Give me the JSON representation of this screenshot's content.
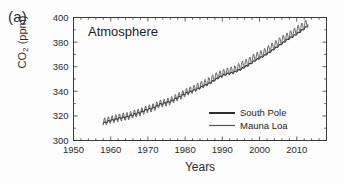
{
  "figure": {
    "panel_label": "(a)",
    "background_color": "#fdfdfd",
    "axis_color": "#3a3a3a"
  },
  "chart_data": {
    "type": "line",
    "title": "Atmosphere",
    "xlabel": "Years",
    "ylabel": "CO2 (ppm)",
    "ylabel_base": "CO",
    "ylabel_sub": "2",
    "ylabel_unit": " (ppm)",
    "xlim": [
      1950,
      2018
    ],
    "ylim": [
      300,
      400
    ],
    "xticks": [
      1950,
      1960,
      1970,
      1980,
      1990,
      2000,
      2010
    ],
    "xtick_labels": [
      "1950",
      "1960",
      "1970",
      "1980",
      "1990",
      "2000",
      "2010"
    ],
    "yticks": [
      300,
      320,
      340,
      360,
      380,
      400
    ],
    "ytick_labels": [
      "300",
      "320",
      "340",
      "360",
      "380",
      "400"
    ],
    "x_minor_step": 2,
    "y_minor_step": 10,
    "grid": false,
    "legend_position": "lower-right",
    "seasonal_amplitude_south_pole": 0.6,
    "seasonal_amplitude_mauna_loa": 3.1,
    "series": [
      {
        "name": "South Pole",
        "color": "#2e2e2e",
        "line_width": 1.1,
        "x": [
          1958.0,
          1959.0,
          1960.0,
          1961.0,
          1962.0,
          1963.0,
          1964.0,
          1965.0,
          1966.0,
          1967.0,
          1968.0,
          1969.0,
          1970.0,
          1971.0,
          1972.0,
          1973.0,
          1974.0,
          1975.0,
          1976.0,
          1977.0,
          1978.0,
          1979.0,
          1980.0,
          1981.0,
          1982.0,
          1983.0,
          1984.0,
          1985.0,
          1986.0,
          1987.0,
          1988.0,
          1989.0,
          1990.0,
          1991.0,
          1992.0,
          1993.0,
          1994.0,
          1995.0,
          1996.0,
          1997.0,
          1998.0,
          1999.0,
          2000.0,
          2001.0,
          2002.0,
          2003.0,
          2004.0,
          2005.0,
          2006.0,
          2007.0,
          2008.0,
          2009.0,
          2010.0,
          2011.0,
          2012.0,
          2013.0
        ],
        "values": [
          314.0,
          315.3,
          316.4,
          317.0,
          317.9,
          318.6,
          319.0,
          319.8,
          321.0,
          322.0,
          322.9,
          324.3,
          325.4,
          326.1,
          327.3,
          329.1,
          330.0,
          330.9,
          331.8,
          333.2,
          334.8,
          336.4,
          338.1,
          339.2,
          340.3,
          341.5,
          343.0,
          344.4,
          345.8,
          347.4,
          349.2,
          351.2,
          352.7,
          354.0,
          354.6,
          355.4,
          356.6,
          358.0,
          359.7,
          361.3,
          363.4,
          365.4,
          367.0,
          368.5,
          370.4,
          372.4,
          374.6,
          376.6,
          378.8,
          380.9,
          383.0,
          384.6,
          386.6,
          388.7,
          390.9,
          393.4
        ]
      },
      {
        "name": "Mauna Loa",
        "color": "#555555",
        "line_width": 0.9,
        "x": [
          1958.0,
          1959.0,
          1960.0,
          1961.0,
          1962.0,
          1963.0,
          1964.0,
          1965.0,
          1966.0,
          1967.0,
          1968.0,
          1969.0,
          1970.0,
          1971.0,
          1972.0,
          1973.0,
          1974.0,
          1975.0,
          1976.0,
          1977.0,
          1978.0,
          1979.0,
          1980.0,
          1981.0,
          1982.0,
          1983.0,
          1984.0,
          1985.0,
          1986.0,
          1987.0,
          1988.0,
          1989.0,
          1990.0,
          1991.0,
          1992.0,
          1993.0,
          1994.0,
          1995.0,
          1996.0,
          1997.0,
          1998.0,
          1999.0,
          2000.0,
          2001.0,
          2002.0,
          2003.0,
          2004.0,
          2005.0,
          2006.0,
          2007.0,
          2008.0,
          2009.0,
          2010.0,
          2011.0,
          2012.0,
          2013.0
        ],
        "values": [
          315.0,
          315.9,
          316.9,
          317.6,
          318.4,
          319.0,
          319.6,
          320.0,
          321.4,
          322.2,
          323.0,
          324.6,
          325.7,
          326.3,
          327.5,
          329.7,
          330.2,
          331.1,
          332.0,
          333.8,
          335.4,
          336.8,
          338.7,
          340.1,
          341.4,
          343.0,
          344.6,
          346.0,
          347.4,
          349.2,
          351.6,
          353.1,
          354.4,
          355.6,
          356.4,
          357.1,
          358.8,
          360.8,
          362.6,
          363.8,
          366.6,
          368.3,
          369.5,
          371.0,
          373.1,
          375.6,
          377.4,
          379.7,
          381.9,
          383.7,
          385.6,
          387.4,
          389.9,
          391.6,
          393.8,
          396.5
        ]
      }
    ]
  },
  "legend": {
    "items": [
      {
        "label": "South Pole",
        "color": "#2e2e2e",
        "line_width": 2.0
      },
      {
        "label": "Mauna Loa",
        "color": "#555555",
        "line_width": 1.2
      }
    ]
  }
}
